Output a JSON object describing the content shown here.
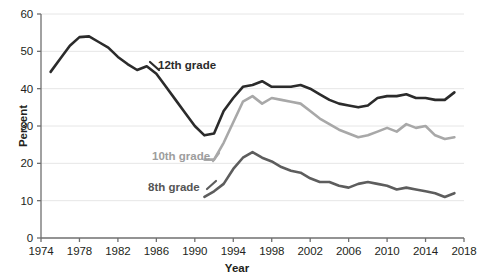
{
  "chart_data": {
    "type": "line",
    "title": "",
    "xlabel": "Year",
    "ylabel": "Percent",
    "xlim": [
      1974,
      2018
    ],
    "ylim": [
      0,
      60
    ],
    "ytick_values": [
      0,
      10,
      20,
      30,
      40,
      50,
      60
    ],
    "ytick_labels": [
      "0",
      "10",
      "20",
      "30",
      "40",
      "50",
      "60"
    ],
    "xtick_values": [
      1974,
      1978,
      1982,
      1986,
      1990,
      1994,
      1998,
      2002,
      2006,
      2010,
      2014,
      2018
    ],
    "xtick_labels": [
      "1974",
      "1978",
      "1982",
      "1986",
      "1990",
      "1994",
      "1998",
      "2002",
      "2006",
      "2010",
      "2014",
      "2018"
    ],
    "grid": true,
    "grid_axis": "y",
    "legend_position": "inline-labels",
    "colors": {
      "grade12": "#2b2b2b",
      "grade10": "#a8a8a8",
      "grade8": "#5d5d5d",
      "grid": "#e6e6e6",
      "axis": "#6f6f6f",
      "text": "#231f20"
    },
    "series": [
      {
        "name": "12th grade",
        "color": "#2b2b2b",
        "label": "12th grade",
        "x": [
          1975,
          1976,
          1977,
          1978,
          1979,
          1980,
          1981,
          1982,
          1983,
          1984,
          1985,
          1986,
          1987,
          1988,
          1989,
          1990,
          1991,
          1992,
          1993,
          1994,
          1995,
          1996,
          1997,
          1998,
          1999,
          2000,
          2001,
          2002,
          2003,
          2004,
          2005,
          2006,
          2007,
          2008,
          2009,
          2010,
          2011,
          2012,
          2013,
          2014,
          2015,
          2016,
          2017
        ],
        "values": [
          44.5,
          48.0,
          51.5,
          53.8,
          54.0,
          52.5,
          51.0,
          48.5,
          46.6,
          45.0,
          46.0,
          44.0,
          40.5,
          37.0,
          33.5,
          30.0,
          27.5,
          28.0,
          34.0,
          37.5,
          40.5,
          41.0,
          42.0,
          40.5,
          40.5,
          40.5,
          41.0,
          40.0,
          38.5,
          37.0,
          36.0,
          35.5,
          35.0,
          35.5,
          37.5,
          38.0,
          38.0,
          38.5,
          37.5,
          37.5,
          37.0,
          37.0,
          39.0
        ]
      },
      {
        "name": "10th grade",
        "color": "#a8a8a8",
        "label": "10th grade",
        "x": [
          1991,
          1992,
          1993,
          1994,
          1995,
          1996,
          1997,
          1998,
          1999,
          2000,
          2001,
          2002,
          2003,
          2004,
          2005,
          2006,
          2007,
          2008,
          2009,
          2010,
          2011,
          2012,
          2013,
          2014,
          2015,
          2016,
          2017
        ],
        "values": [
          21.0,
          21.0,
          25.5,
          31.0,
          36.5,
          38.0,
          36.0,
          37.5,
          37.0,
          36.5,
          36.0,
          34.0,
          32.0,
          30.5,
          29.0,
          28.0,
          27.0,
          27.5,
          28.5,
          29.5,
          28.5,
          30.5,
          29.5,
          30.0,
          27.5,
          26.5,
          27.0
        ]
      },
      {
        "name": "8th grade",
        "color": "#5d5d5d",
        "label": "8th grade",
        "x": [
          1991,
          1992,
          1993,
          1994,
          1995,
          1996,
          1997,
          1998,
          1999,
          2000,
          2001,
          2002,
          2003,
          2004,
          2005,
          2006,
          2007,
          2008,
          2009,
          2010,
          2011,
          2012,
          2013,
          2014,
          2015,
          2016,
          2017
        ],
        "values": [
          11.0,
          12.5,
          14.5,
          18.5,
          21.5,
          23.0,
          21.5,
          20.5,
          19.0,
          18.0,
          17.5,
          16.0,
          15.0,
          15.0,
          14.0,
          13.5,
          14.5,
          15.0,
          14.5,
          14.0,
          13.0,
          13.5,
          13.0,
          12.5,
          12.0,
          11.0,
          12.0
        ]
      }
    ]
  }
}
